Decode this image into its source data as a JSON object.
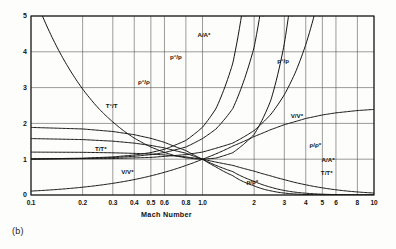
{
  "caption": "(b)",
  "chart_data": {
    "type": "line",
    "title": "",
    "subtitle": "",
    "xlabel": "Mach Number",
    "ylabel": "",
    "xscale": "log",
    "yscale": "linear",
    "xlim": [
      0.1,
      10
    ],
    "ylim": [
      0,
      5
    ],
    "grid": true,
    "legend_position": "inline-labels",
    "xticks": [
      0.1,
      0.2,
      0.3,
      0.4,
      0.5,
      0.6,
      0.8,
      1.0,
      2,
      3,
      4,
      5,
      6,
      8,
      10
    ],
    "xtick_labels": [
      "0.1",
      "0.2",
      "0.3",
      "0.4",
      "0.5",
      "0.6",
      "0.8",
      "1.0",
      "2",
      "3",
      "4",
      "5",
      "6",
      "8",
      "10"
    ],
    "yticks": [
      0,
      1,
      2,
      3,
      4,
      5
    ],
    "ytick_labels": [
      "0",
      "1",
      "2",
      "3",
      "4",
      "5"
    ],
    "annotations": [
      {
        "text": "A/A*",
        "x": 1.02,
        "y": 4.42,
        "name": "label-area-ratio-left"
      },
      {
        "text": "p°/p",
        "x": 0.7,
        "y": 3.8,
        "name": "label-stag-pressure-left"
      },
      {
        "text": "ρ°/ρ",
        "x": 0.455,
        "y": 3.1,
        "name": "label-stag-density-left"
      },
      {
        "text": "T°/T",
        "x": 0.295,
        "y": 2.42,
        "name": "label-stag-temperature-left"
      },
      {
        "text": "T/T*",
        "x": 0.255,
        "y": 1.23,
        "name": "label-temperature-ratio-left"
      },
      {
        "text": "V/V*",
        "x": 0.365,
        "y": 0.6,
        "name": "label-velocity-ratio-left"
      },
      {
        "text": "p°/p",
        "x": 2.95,
        "y": 3.7,
        "name": "label-stag-pressure-right"
      },
      {
        "text": "V/V*",
        "x": 3.55,
        "y": 2.14,
        "name": "label-velocity-ratio-right"
      },
      {
        "text": "ρ/ρ*",
        "x": 4.55,
        "y": 1.34,
        "name": "label-density-ratio-right"
      },
      {
        "text": "A/A*",
        "x": 5.4,
        "y": 0.92,
        "name": "label-area-ratio-right"
      },
      {
        "text": "T/T*",
        "x": 5.3,
        "y": 0.55,
        "name": "label-temperature-ratio-right"
      },
      {
        "text": "p/p*",
        "x": 1.95,
        "y": 0.3,
        "name": "label-pressure-ratio-bottom"
      }
    ],
    "series": [
      {
        "name": "A/A*",
        "label": "A/A*",
        "description": "Area ratio, minimum 1.0 at M=1",
        "points": [
          [
            0.1,
            5.82
          ],
          [
            0.12,
            4.86
          ],
          [
            0.15,
            3.91
          ],
          [
            0.2,
            2.96
          ],
          [
            0.25,
            2.4
          ],
          [
            0.3,
            2.04
          ],
          [
            0.35,
            1.78
          ],
          [
            0.4,
            1.59
          ],
          [
            0.5,
            1.34
          ],
          [
            0.6,
            1.19
          ],
          [
            0.7,
            1.09
          ],
          [
            0.8,
            1.04
          ],
          [
            0.9,
            1.01
          ],
          [
            1.0,
            1.0
          ],
          [
            1.2,
            1.03
          ],
          [
            1.5,
            1.18
          ],
          [
            2.0,
            1.69
          ],
          [
            2.5,
            2.64
          ],
          [
            3.0,
            4.23
          ],
          [
            3.3,
            5.62
          ],
          [
            4.0,
            10.72
          ],
          [
            5.0,
            25.0
          ],
          [
            6.0,
            53.2
          ],
          [
            8.0,
            109.1
          ],
          [
            10.0,
            535.9
          ]
        ]
      },
      {
        "name": "p0/p",
        "label": "p°/p",
        "description": "Stagnation to static pressure ratio",
        "points": [
          [
            0.1,
            1.007
          ],
          [
            0.2,
            1.028
          ],
          [
            0.3,
            1.064
          ],
          [
            0.4,
            1.117
          ],
          [
            0.5,
            1.186
          ],
          [
            0.6,
            1.276
          ],
          [
            0.8,
            1.524
          ],
          [
            1.0,
            1.893
          ],
          [
            1.2,
            2.42
          ],
          [
            1.5,
            3.67
          ],
          [
            2.0,
            7.82
          ],
          [
            2.5,
            17.09
          ],
          [
            3.0,
            36.73
          ],
          [
            3.5,
            76.3
          ],
          [
            4.0,
            151.8
          ]
        ]
      },
      {
        "name": "rho0/rho",
        "label": "ρ°/ρ",
        "description": "Stagnation to static density ratio",
        "points": [
          [
            0.1,
            1.005
          ],
          [
            0.2,
            1.02
          ],
          [
            0.3,
            1.045
          ],
          [
            0.4,
            1.081
          ],
          [
            0.5,
            1.128
          ],
          [
            0.6,
            1.186
          ],
          [
            0.8,
            1.34
          ],
          [
            1.0,
            1.577
          ],
          [
            1.2,
            1.846
          ],
          [
            1.5,
            2.41
          ],
          [
            2.0,
            4.13
          ],
          [
            2.5,
            7.23
          ],
          [
            3.0,
            12.44
          ],
          [
            3.5,
            20.4
          ],
          [
            4.0,
            31.5
          ]
        ]
      },
      {
        "name": "T0/T",
        "label": "T°/T",
        "description": "Stagnation to static temperature ratio",
        "points": [
          [
            0.1,
            1.002
          ],
          [
            0.3,
            1.018
          ],
          [
            0.5,
            1.05
          ],
          [
            0.8,
            1.128
          ],
          [
            1.0,
            1.2
          ],
          [
            1.5,
            1.45
          ],
          [
            2.0,
            1.8
          ],
          [
            2.5,
            2.25
          ],
          [
            3.0,
            2.8
          ],
          [
            3.5,
            3.45
          ],
          [
            4.0,
            4.2
          ],
          [
            4.5,
            5.05
          ],
          [
            5.0,
            6.0
          ]
        ]
      },
      {
        "name": "T/T*",
        "label": "T/T*",
        "description": "Static temperature over sonic temperature, decreasing",
        "points": [
          [
            0.1,
            1.198
          ],
          [
            0.2,
            1.192
          ],
          [
            0.3,
            1.179
          ],
          [
            0.4,
            1.163
          ],
          [
            0.5,
            1.143
          ],
          [
            0.6,
            1.119
          ],
          [
            0.8,
            1.064
          ],
          [
            1.0,
            1.0
          ],
          [
            1.5,
            0.828
          ],
          [
            2.0,
            0.667
          ],
          [
            2.5,
            0.533
          ],
          [
            3.0,
            0.429
          ],
          [
            4.0,
            0.286
          ],
          [
            5.0,
            0.2
          ],
          [
            6.0,
            0.146
          ],
          [
            8.0,
            0.085
          ],
          [
            10.0,
            0.055
          ]
        ]
      },
      {
        "name": "V/V*",
        "label": "V/V*",
        "description": "Velocity over sonic velocity, increasing toward 2.45",
        "points": [
          [
            0.1,
            0.109
          ],
          [
            0.2,
            0.218
          ],
          [
            0.3,
            0.326
          ],
          [
            0.4,
            0.431
          ],
          [
            0.5,
            0.534
          ],
          [
            0.6,
            0.635
          ],
          [
            0.8,
            0.825
          ],
          [
            1.0,
            1.0
          ],
          [
            1.25,
            1.187
          ],
          [
            1.5,
            1.365
          ],
          [
            2.0,
            1.633
          ],
          [
            2.5,
            1.826
          ],
          [
            3.0,
            1.964
          ],
          [
            4.0,
            2.138
          ],
          [
            5.0,
            2.236
          ],
          [
            6.0,
            2.295
          ],
          [
            8.0,
            2.359
          ],
          [
            10.0,
            2.39
          ]
        ]
      },
      {
        "name": "rho/rho*",
        "label": "ρ/ρ*",
        "description": "Static density over sonic density, decreasing",
        "points": [
          [
            0.1,
            1.576
          ],
          [
            0.2,
            1.548
          ],
          [
            0.3,
            1.504
          ],
          [
            0.4,
            1.449
          ],
          [
            0.5,
            1.385
          ],
          [
            0.6,
            1.315
          ],
          [
            0.8,
            1.167
          ],
          [
            1.0,
            1.0
          ],
          [
            1.5,
            0.654
          ],
          [
            2.0,
            0.382
          ],
          [
            2.5,
            0.218
          ],
          [
            3.0,
            0.127
          ],
          [
            4.0,
            0.05
          ],
          [
            5.0,
            0.0226
          ],
          [
            6.0,
            0.0118
          ],
          [
            8.0,
            0.0041
          ],
          [
            10.0,
            0.0018
          ]
        ]
      },
      {
        "name": "p/p*",
        "label": "p/p*",
        "description": "Static pressure over sonic pressure, decreasing steeply",
        "points": [
          [
            0.1,
            1.888
          ],
          [
            0.2,
            1.845
          ],
          [
            0.3,
            1.774
          ],
          [
            0.4,
            1.685
          ],
          [
            0.5,
            1.583
          ],
          [
            0.6,
            1.471
          ],
          [
            0.8,
            1.242
          ],
          [
            1.0,
            1.0
          ],
          [
            1.2,
            0.782
          ],
          [
            1.5,
            0.541
          ],
          [
            2.0,
            0.2553
          ],
          [
            2.5,
            0.1162
          ],
          [
            3.0,
            0.0544
          ],
          [
            4.0,
            0.01426
          ],
          [
            5.0,
            0.00452
          ],
          [
            6.0,
            0.00173
          ],
          [
            8.0,
            0.00035
          ],
          [
            10.0,
            9.99e-05
          ]
        ]
      }
    ]
  }
}
